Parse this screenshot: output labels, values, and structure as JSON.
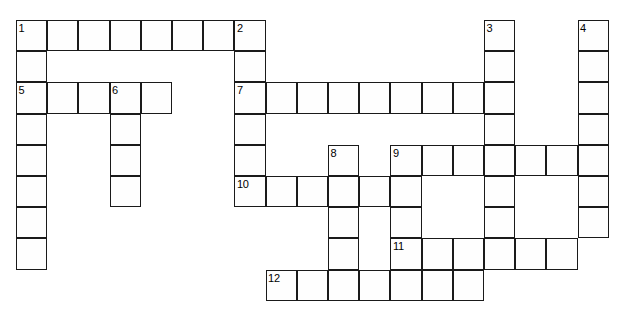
{
  "puzzle": {
    "type": "crossword-grid",
    "title": "",
    "grid": {
      "cell_size": 31.2,
      "origin_x": 16,
      "origin_y": 20,
      "line_color": "#1a1a1a",
      "cell_fill": "#fefefe",
      "background": "#ffffff"
    },
    "entries": [
      {
        "number": "1",
        "direction": "across",
        "col": 0,
        "row": 0,
        "length": 8
      },
      {
        "number": "1",
        "direction": "down",
        "col": 0,
        "row": 0,
        "length": 8
      },
      {
        "number": "2",
        "direction": "down",
        "col": 7,
        "row": 0,
        "length": 6
      },
      {
        "number": "3",
        "direction": "down",
        "col": 15,
        "row": 0,
        "length": 7
      },
      {
        "number": "4",
        "direction": "down",
        "col": 18,
        "row": 0,
        "length": 7
      },
      {
        "number": "5",
        "direction": "across",
        "col": 0,
        "row": 2,
        "length": 5
      },
      {
        "number": "6",
        "direction": "down",
        "col": 3,
        "row": 2,
        "length": 4
      },
      {
        "number": "7",
        "direction": "across",
        "col": 7,
        "row": 2,
        "length": 8
      },
      {
        "number": "8",
        "direction": "down",
        "col": 10,
        "row": 4,
        "length": 5
      },
      {
        "number": "9",
        "direction": "across",
        "col": 12,
        "row": 4,
        "length": 7
      },
      {
        "number": "9",
        "direction": "down",
        "col": 12,
        "row": 4,
        "length": 4
      },
      {
        "number": "10",
        "direction": "across",
        "col": 7,
        "row": 5,
        "length": 5
      },
      {
        "number": "11",
        "direction": "across",
        "col": 12,
        "row": 7,
        "length": 6
      },
      {
        "number": "12",
        "direction": "across",
        "col": 8,
        "row": 8,
        "length": 7
      }
    ],
    "numbered_labels": [
      "1",
      "2",
      "3",
      "4",
      "5",
      "6",
      "7",
      "8",
      "9",
      "10",
      "11",
      "12"
    ],
    "cells": [
      {
        "col": 0,
        "row": 0,
        "number": "1"
      },
      {
        "col": 1,
        "row": 0,
        "number": ""
      },
      {
        "col": 2,
        "row": 0,
        "number": ""
      },
      {
        "col": 3,
        "row": 0,
        "number": ""
      },
      {
        "col": 4,
        "row": 0,
        "number": ""
      },
      {
        "col": 5,
        "row": 0,
        "number": ""
      },
      {
        "col": 6,
        "row": 0,
        "number": ""
      },
      {
        "col": 7,
        "row": 0,
        "number": "2"
      },
      {
        "col": 15,
        "row": 0,
        "number": "3"
      },
      {
        "col": 18,
        "row": 0,
        "number": "4"
      },
      {
        "col": 0,
        "row": 1,
        "number": ""
      },
      {
        "col": 7,
        "row": 1,
        "number": ""
      },
      {
        "col": 15,
        "row": 1,
        "number": ""
      },
      {
        "col": 18,
        "row": 1,
        "number": ""
      },
      {
        "col": 0,
        "row": 2,
        "number": "5"
      },
      {
        "col": 1,
        "row": 2,
        "number": ""
      },
      {
        "col": 2,
        "row": 2,
        "number": ""
      },
      {
        "col": 3,
        "row": 2,
        "number": "6"
      },
      {
        "col": 4,
        "row": 2,
        "number": ""
      },
      {
        "col": 7,
        "row": 2,
        "number": "7"
      },
      {
        "col": 8,
        "row": 2,
        "number": ""
      },
      {
        "col": 9,
        "row": 2,
        "number": ""
      },
      {
        "col": 10,
        "row": 2,
        "number": ""
      },
      {
        "col": 11,
        "row": 2,
        "number": ""
      },
      {
        "col": 12,
        "row": 2,
        "number": ""
      },
      {
        "col": 13,
        "row": 2,
        "number": ""
      },
      {
        "col": 14,
        "row": 2,
        "number": ""
      },
      {
        "col": 15,
        "row": 2,
        "number": ""
      },
      {
        "col": 18,
        "row": 2,
        "number": ""
      },
      {
        "col": 0,
        "row": 3,
        "number": ""
      },
      {
        "col": 3,
        "row": 3,
        "number": ""
      },
      {
        "col": 7,
        "row": 3,
        "number": ""
      },
      {
        "col": 15,
        "row": 3,
        "number": ""
      },
      {
        "col": 18,
        "row": 3,
        "number": ""
      },
      {
        "col": 0,
        "row": 4,
        "number": ""
      },
      {
        "col": 3,
        "row": 4,
        "number": ""
      },
      {
        "col": 7,
        "row": 4,
        "number": ""
      },
      {
        "col": 10,
        "row": 4,
        "number": "8"
      },
      {
        "col": 12,
        "row": 4,
        "number": "9"
      },
      {
        "col": 13,
        "row": 4,
        "number": ""
      },
      {
        "col": 14,
        "row": 4,
        "number": ""
      },
      {
        "col": 15,
        "row": 4,
        "number": ""
      },
      {
        "col": 16,
        "row": 4,
        "number": ""
      },
      {
        "col": 17,
        "row": 4,
        "number": ""
      },
      {
        "col": 18,
        "row": 4,
        "number": ""
      },
      {
        "col": 0,
        "row": 5,
        "number": ""
      },
      {
        "col": 3,
        "row": 5,
        "number": ""
      },
      {
        "col": 7,
        "row": 5,
        "number": "10"
      },
      {
        "col": 8,
        "row": 5,
        "number": ""
      },
      {
        "col": 9,
        "row": 5,
        "number": ""
      },
      {
        "col": 10,
        "row": 5,
        "number": ""
      },
      {
        "col": 11,
        "row": 5,
        "number": ""
      },
      {
        "col": 12,
        "row": 5,
        "number": ""
      },
      {
        "col": 15,
        "row": 5,
        "number": ""
      },
      {
        "col": 18,
        "row": 5,
        "number": ""
      },
      {
        "col": 0,
        "row": 6,
        "number": ""
      },
      {
        "col": 10,
        "row": 6,
        "number": ""
      },
      {
        "col": 12,
        "row": 6,
        "number": ""
      },
      {
        "col": 15,
        "row": 6,
        "number": ""
      },
      {
        "col": 18,
        "row": 6,
        "number": ""
      },
      {
        "col": 0,
        "row": 7,
        "number": ""
      },
      {
        "col": 10,
        "row": 7,
        "number": ""
      },
      {
        "col": 12,
        "row": 7,
        "number": "11"
      },
      {
        "col": 13,
        "row": 7,
        "number": ""
      },
      {
        "col": 14,
        "row": 7,
        "number": ""
      },
      {
        "col": 15,
        "row": 7,
        "number": ""
      },
      {
        "col": 16,
        "row": 7,
        "number": ""
      },
      {
        "col": 17,
        "row": 7,
        "number": ""
      },
      {
        "col": 8,
        "row": 8,
        "number": "12"
      },
      {
        "col": 9,
        "row": 8,
        "number": ""
      },
      {
        "col": 10,
        "row": 8,
        "number": ""
      },
      {
        "col": 11,
        "row": 8,
        "number": ""
      },
      {
        "col": 12,
        "row": 8,
        "number": ""
      },
      {
        "col": 13,
        "row": 8,
        "number": ""
      },
      {
        "col": 14,
        "row": 8,
        "number": ""
      }
    ]
  }
}
